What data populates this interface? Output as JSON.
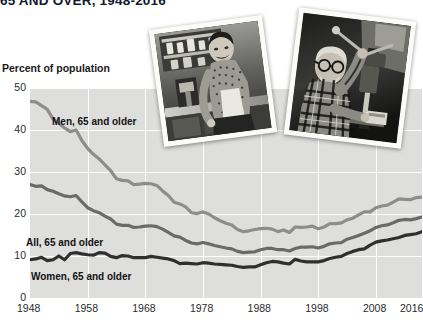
{
  "title": "65 AND OVER, 1948-2016",
  "axis_caption": "Percent of population",
  "photos": [
    {
      "name": "photo-woman",
      "caption": "black-and-white photo of an older woman working in a kitchen"
    },
    {
      "name": "photo-man",
      "caption": "black-and-white photo of an older man operating a drill press"
    }
  ],
  "series_labels": {
    "men": "Men, 65 and older",
    "all": "All, 65 and older",
    "women": "Women, 65 and older"
  },
  "colors": {
    "plot_background": "#dededd",
    "gridline": "#ffffff",
    "men_line": "#8d8d8d",
    "all_line": "#6a6a6a",
    "women_line": "#2f2f2f",
    "title_text": "#111a2e",
    "tick_text": "#2b2b2b"
  },
  "chart_data": {
    "type": "line",
    "title": "65 AND OVER, 1948-2016",
    "subtitle": "",
    "xlabel": "",
    "ylabel": "Percent of population",
    "xlim": [
      1948,
      2016
    ],
    "ylim": [
      0,
      50
    ],
    "ytick_labels": [
      "0",
      "10",
      "20",
      "30",
      "40",
      "50"
    ],
    "ytick_values": [
      0,
      10,
      20,
      30,
      40,
      50
    ],
    "xtick_labels": [
      "1948",
      "1958",
      "1968",
      "1978",
      "1988",
      "1998",
      "2008",
      "2016"
    ],
    "xtick_values": [
      1948,
      1958,
      1968,
      1978,
      1988,
      1998,
      2008,
      2016
    ],
    "grid": true,
    "legend": "inline-annotations",
    "x": [
      1948,
      1949,
      1950,
      1951,
      1952,
      1953,
      1954,
      1955,
      1956,
      1957,
      1958,
      1959,
      1960,
      1961,
      1962,
      1963,
      1964,
      1965,
      1966,
      1967,
      1968,
      1969,
      1970,
      1971,
      1972,
      1973,
      1974,
      1975,
      1976,
      1977,
      1978,
      1979,
      1980,
      1981,
      1982,
      1983,
      1984,
      1985,
      1986,
      1987,
      1988,
      1989,
      1990,
      1991,
      1992,
      1993,
      1994,
      1995,
      1996,
      1997,
      1998,
      1999,
      2000,
      2001,
      2002,
      2003,
      2004,
      2005,
      2006,
      2007,
      2008,
      2009,
      2010,
      2011,
      2012,
      2013,
      2014,
      2015,
      2016
    ],
    "series": [
      {
        "name": "Men, 65 and older",
        "color": "#8d8d8d",
        "values": [
          46.8,
          46.7,
          45.8,
          44.9,
          42.6,
          41.6,
          40.5,
          39.6,
          40.0,
          37.5,
          35.6,
          34.2,
          33.1,
          31.7,
          30.3,
          28.4,
          28.0,
          27.9,
          27.0,
          27.1,
          27.3,
          27.2,
          26.8,
          25.5,
          24.4,
          22.8,
          22.4,
          21.7,
          20.3,
          20.1,
          20.5,
          20.0,
          19.1,
          18.4,
          17.8,
          17.4,
          16.3,
          15.8,
          16.0,
          16.3,
          16.5,
          16.6,
          16.4,
          15.8,
          16.2,
          15.6,
          16.9,
          16.8,
          16.9,
          17.1,
          16.5,
          16.9,
          17.7,
          17.7,
          17.9,
          18.6,
          19.0,
          19.8,
          20.5,
          20.5,
          21.5,
          21.9,
          22.1,
          22.8,
          23.6,
          23.5,
          23.4,
          23.9,
          24.0
        ]
      },
      {
        "name": "All, 65 and older",
        "color": "#6a6a6a",
        "values": [
          27.0,
          26.6,
          26.7,
          25.8,
          25.4,
          24.8,
          24.3,
          24.1,
          24.4,
          22.9,
          21.5,
          20.8,
          20.3,
          19.5,
          18.8,
          17.6,
          17.3,
          17.3,
          16.8,
          16.9,
          17.1,
          17.2,
          17.0,
          16.4,
          15.6,
          14.8,
          14.5,
          13.7,
          13.1,
          12.9,
          13.2,
          12.9,
          12.5,
          12.2,
          11.9,
          11.7,
          11.1,
          10.8,
          10.9,
          11.0,
          11.5,
          11.8,
          11.8,
          11.5,
          11.5,
          11.2,
          11.8,
          12.1,
          12.1,
          12.2,
          11.9,
          12.3,
          12.9,
          13.1,
          13.2,
          14.0,
          14.4,
          14.9,
          15.4,
          16.0,
          16.8,
          17.2,
          17.4,
          17.9,
          18.5,
          18.7,
          18.6,
          18.9,
          19.3
        ]
      },
      {
        "name": "Women, 65 and older",
        "color": "#2f2f2f",
        "values": [
          9.1,
          9.3,
          9.7,
          8.9,
          9.1,
          10.0,
          9.1,
          10.6,
          10.8,
          10.5,
          10.3,
          10.2,
          10.8,
          10.7,
          9.9,
          9.6,
          10.1,
          10.0,
          9.6,
          9.6,
          9.6,
          9.9,
          9.7,
          9.5,
          9.3,
          8.9,
          8.2,
          8.3,
          8.2,
          8.1,
          8.4,
          8.3,
          8.1,
          8.0,
          7.9,
          7.8,
          7.5,
          7.3,
          7.4,
          7.4,
          7.9,
          8.4,
          8.7,
          8.6,
          8.3,
          8.1,
          9.2,
          8.8,
          8.6,
          8.6,
          8.6,
          8.9,
          9.4,
          9.7,
          9.9,
          10.6,
          11.1,
          11.5,
          11.7,
          12.6,
          13.3,
          13.6,
          13.8,
          14.1,
          14.4,
          14.9,
          15.1,
          15.3,
          15.8
        ]
      }
    ]
  }
}
